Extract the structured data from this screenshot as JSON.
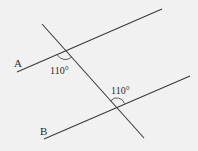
{
  "diagram": {
    "type": "parallel-lines-transversal",
    "background": "#f1f1f1",
    "line_color": "#3a3a3a",
    "lines": {
      "A": {
        "label": "A",
        "x1": 17,
        "y1": 72,
        "x2": 162,
        "y2": 9
      },
      "B": {
        "label": "B",
        "x1": 44,
        "y1": 139,
        "x2": 190,
        "y2": 76
      },
      "transversal": {
        "x1": 42,
        "y1": 24,
        "x2": 144,
        "y2": 138
      }
    },
    "angles": [
      {
        "label": "110°",
        "at_line": "A",
        "position": "below-left of intersection"
      },
      {
        "label": "110°",
        "at_line": "B",
        "position": "above-left of intersection"
      }
    ],
    "labels": {
      "line_a": "A",
      "line_b": "B",
      "angle_1": "110°",
      "angle_2": "110°"
    }
  }
}
